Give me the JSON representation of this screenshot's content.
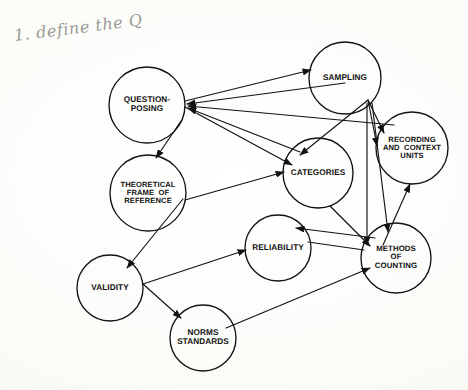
{
  "document": {
    "type": "concept-map-diagram",
    "title": "Content Analysis Concept Map",
    "background_color": "#fdfdfb",
    "ink_color": "#121212",
    "annotation_color": "#9a9a96",
    "width": 468,
    "height": 390
  },
  "annotation": {
    "handwritten_note": "1. define the Q"
  },
  "nodes": [
    {
      "id": "question-posing",
      "label": "QUESTION-\nPOSING",
      "cx": 147,
      "cy": 105,
      "r": 38,
      "font_size": 8.2
    },
    {
      "id": "sampling",
      "label": "SAMPLING",
      "cx": 345,
      "cy": 78,
      "r": 36,
      "font_size": 8.2
    },
    {
      "id": "recording-and-context-units",
      "label": "RECORDING\nAND  CONTEXT\nUNITS",
      "cx": 412,
      "cy": 148,
      "r": 36,
      "font_size": 7.6
    },
    {
      "id": "categories",
      "label": "CATEGORIES",
      "cx": 318,
      "cy": 173,
      "r": 35,
      "font_size": 8.2
    },
    {
      "id": "theoretical-frame-of-reference",
      "label": "THEORETICAL\nFRAME  OF\nREFERENCE",
      "cx": 148,
      "cy": 193,
      "r": 38,
      "font_size": 7.6
    },
    {
      "id": "reliability",
      "label": "RELIABILITY",
      "cx": 278,
      "cy": 248,
      "r": 33,
      "font_size": 8.2
    },
    {
      "id": "methods-of-counting",
      "label": "METHODS\nOF\nCOUNTING",
      "cx": 396,
      "cy": 258,
      "r": 35,
      "font_size": 7.8
    },
    {
      "id": "validity",
      "label": "VALIDITY",
      "cx": 110,
      "cy": 288,
      "r": 33,
      "font_size": 8.2
    },
    {
      "id": "norms-standards",
      "label": "NORMS\nSTANDARDS",
      "cx": 203,
      "cy": 338,
      "r": 33,
      "font_size": 8.2
    }
  ],
  "edges": [
    {
      "id": "e1",
      "from": "question-posing",
      "to": "sampling",
      "path": "M 185 101 L 311 70",
      "arrow": "end"
    },
    {
      "id": "e2",
      "from": "sampling",
      "to": "question-posing",
      "path": "M 345 83 L 187 104",
      "arrow": "end"
    },
    {
      "id": "e3",
      "from": "recording-and-context-units",
      "to": "question-posing",
      "path": "M 394 125 L 188 106",
      "arrow": "end"
    },
    {
      "id": "e4",
      "from": "categories",
      "to": "question-posing",
      "path": "M 300 152 L 188 108",
      "arrow": "end"
    },
    {
      "id": "e5",
      "from": "question-posing",
      "to": "categories",
      "path": "M 185 107 L 292 165",
      "arrow": "end"
    },
    {
      "id": "e6",
      "from": "question-posing",
      "to": "theoretical-frame-of-reference",
      "path": "M 181 121 L 156 158",
      "arrow": "end"
    },
    {
      "id": "e7",
      "from": "theoretical-frame-of-reference",
      "to": "categories",
      "path": "M 185 200 L 284 172",
      "arrow": "end"
    },
    {
      "id": "e8",
      "from": "sampling",
      "to": "categories",
      "path": "M 368 100 L 300 155",
      "arrow": "end"
    },
    {
      "id": "e9",
      "from": "sampling",
      "to": "recording-and-context-units",
      "path": "M 368 100 L 384 133",
      "arrow": "end"
    },
    {
      "id": "e10",
      "from": "sampling",
      "to": "recording-and-context-units",
      "path": "M 368 100 L 377 146",
      "arrow": "end"
    },
    {
      "id": "e11",
      "from": "sampling",
      "to": "methods-of-counting",
      "path": "M 367 103 L 367 245",
      "arrow": "end"
    },
    {
      "id": "e12",
      "from": "sampling",
      "to": "methods-of-counting",
      "path": "M 372 103 L 388 232",
      "arrow": "end"
    },
    {
      "id": "e13",
      "from": "categories",
      "to": "methods-of-counting",
      "path": "M 330 206 L 370 246",
      "arrow": "end"
    },
    {
      "id": "e14",
      "from": "methods-of-counting",
      "to": "recording-and-context-units",
      "path": "M 383 245 L 410 184",
      "arrow": "end"
    },
    {
      "id": "e15",
      "from": "methods-of-counting",
      "to": "reliability",
      "path": "M 375 238 L 296 228",
      "arrow": "end"
    },
    {
      "id": "e16",
      "from": "validity",
      "to": "reliability",
      "path": "M 143 284 L 246 250",
      "arrow": "end"
    },
    {
      "id": "e17",
      "from": "validity",
      "to": "norms-standards",
      "path": "M 143 284 L 181 318",
      "arrow": "end"
    },
    {
      "id": "e18",
      "from": "theoretical-frame-of-reference",
      "to": "validity",
      "path": "M 183 199 L 127 268",
      "arrow": "end"
    },
    {
      "id": "e19",
      "from": "norms-standards",
      "to": "methods-of-counting",
      "path": "M 226 328 L 370 268",
      "arrow": "end"
    },
    {
      "id": "e20",
      "from": "reliability",
      "to": "methods-of-counting",
      "path": "M 308 242 L 364 250",
      "arrow": "none"
    }
  ]
}
